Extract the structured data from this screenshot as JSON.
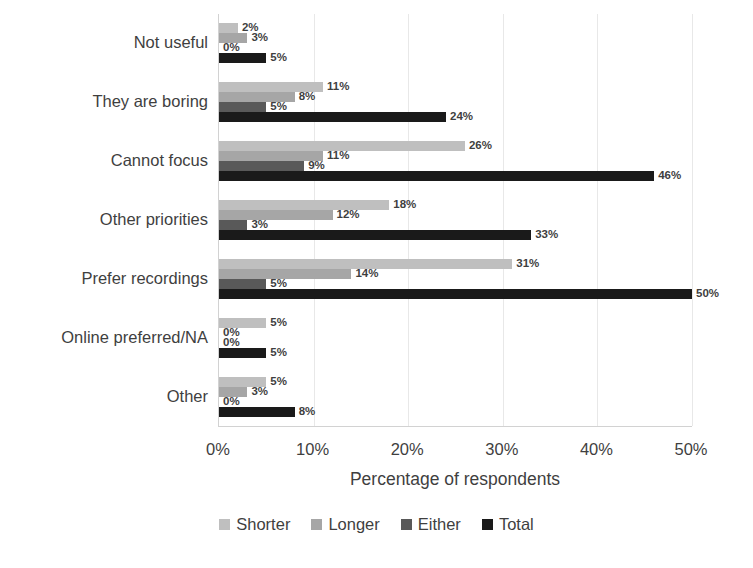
{
  "chart_data": {
    "type": "bar",
    "orientation": "horizontal",
    "title": "",
    "xlabel": "Percentage of respondents",
    "ylabel": "",
    "xlim": [
      0,
      50
    ],
    "xticks": [
      "0%",
      "10%",
      "20%",
      "30%",
      "40%",
      "50%"
    ],
    "xtick_values": [
      0,
      10,
      20,
      30,
      40,
      50
    ],
    "grid": true,
    "legend_position": "bottom",
    "value_label_suffix": "%",
    "categories": [
      "Not useful",
      "They are boring",
      "Cannot focus",
      "Other priorities",
      "Prefer recordings",
      "Online preferred/NA",
      "Other"
    ],
    "series": [
      {
        "name": "Shorter",
        "color": "#bfbfbf",
        "values": [
          2,
          11,
          26,
          18,
          31,
          5,
          5
        ],
        "labels": [
          "2%",
          "11%",
          "26%",
          "18%",
          "31%",
          "5%",
          "5%"
        ]
      },
      {
        "name": "Longer",
        "color": "#a6a6a6",
        "values": [
          3,
          8,
          11,
          12,
          14,
          0,
          3
        ],
        "labels": [
          "3%",
          "8%",
          "11%",
          "12%",
          "14%",
          "0%",
          "3%"
        ]
      },
      {
        "name": "Either",
        "color": "#595959",
        "values": [
          0,
          5,
          9,
          3,
          5,
          0,
          0
        ],
        "labels": [
          "0%",
          "5%",
          "9%",
          "3%",
          "5%",
          "0%",
          "0%"
        ]
      },
      {
        "name": "Total",
        "color": "#1a1a1a",
        "values": [
          5,
          24,
          46,
          33,
          50,
          5,
          8
        ],
        "labels": [
          "5%",
          "24%",
          "46%",
          "33%",
          "50%",
          "5%",
          "8%"
        ]
      }
    ]
  }
}
